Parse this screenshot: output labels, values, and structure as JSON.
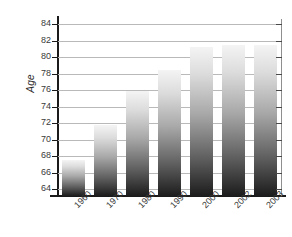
{
  "chart_data": {
    "type": "bar",
    "title": "",
    "subtitle": "",
    "xlabel": "",
    "ylabel": "Age",
    "categories": [
      "1960",
      "1970",
      "1980",
      "1990",
      "2000",
      "2002",
      "2003"
    ],
    "values": [
      67.5,
      71.8,
      75.9,
      78.4,
      81.2,
      81.5,
      81.4
    ],
    "series": [
      {
        "name": "Age",
        "values": [
          67.5,
          71.8,
          75.9,
          78.4,
          81.2,
          81.5,
          81.4
        ]
      }
    ],
    "ylim": [
      63.2,
      84.6
    ],
    "yticks": [
      64,
      66,
      68,
      70,
      72,
      74,
      76,
      78,
      80,
      82,
      84
    ],
    "ytick_labels": [
      "64",
      "66",
      "68",
      "70",
      "72",
      "74",
      "76",
      "78",
      "80",
      "82",
      "84"
    ],
    "xtick_labels": [
      "1960",
      "1970",
      "1980",
      "1990",
      "2000",
      "2002",
      "2003"
    ],
    "grid": true,
    "grid_orientation": "horizontal",
    "legend": false,
    "legend_position": "none",
    "bar_fill": "vertical-gradient-light-to-dark",
    "colors": {
      "bar_top": "#f4f4f4",
      "bar_bottom": "#1c1c1c",
      "gridline": "#b9b9b9",
      "axis": "#1a1a1a",
      "tick_text": "#3a3a3a",
      "background": "#ffffff"
    }
  }
}
